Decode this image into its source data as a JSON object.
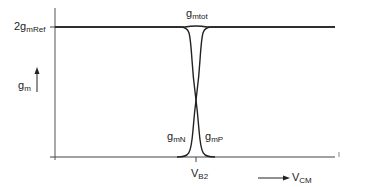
{
  "diagram": {
    "y_axis": {
      "label_main": "g",
      "label_sub": "m",
      "tick_label_main": "2g",
      "tick_label_sub": "mRef"
    },
    "x_axis": {
      "label_main": "V",
      "label_sub": "CM",
      "tick_label_main": "V",
      "tick_label_sub": "B2"
    },
    "curves": [
      {
        "name_main": "g",
        "name_sub": "mtot"
      },
      {
        "name_main": "g",
        "name_sub": "mN"
      },
      {
        "name_main": "g",
        "name_sub": "mP"
      }
    ],
    "line_color": "#222222"
  }
}
